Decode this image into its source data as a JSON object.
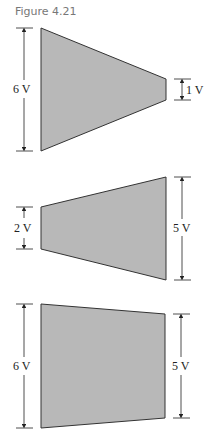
{
  "caption": "Figure 4.21",
  "colors": {
    "shape_fill": "#b8b8b8",
    "shape_stroke": "#333333",
    "dim_line": "#222222"
  },
  "figures": [
    {
      "name": "tapered-converging",
      "left_label": "6 V",
      "right_label": "1 V"
    },
    {
      "name": "tapered-diverging",
      "left_label": "2 V",
      "right_label": "5 V"
    },
    {
      "name": "near-rectangular",
      "left_label": "6 V",
      "right_label": "5 V"
    }
  ]
}
